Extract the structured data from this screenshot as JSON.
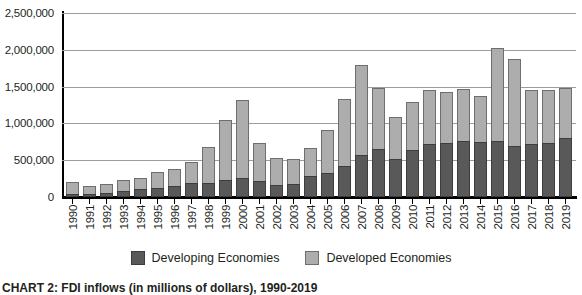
{
  "chart_data": {
    "type": "bar",
    "stacked": true,
    "title": "",
    "xlabel": "",
    "ylabel": "",
    "ylim": [
      0,
      2500000
    ],
    "ytick_values": [
      0,
      500000,
      1000000,
      1500000,
      2000000,
      2500000
    ],
    "ytick_labels": [
      "0",
      "500,000",
      "1,000,000",
      "1,500,000",
      "2,000,000",
      "2,500,000"
    ],
    "grid": true,
    "legend_position": "bottom",
    "categories": [
      "1990",
      "1991",
      "1992",
      "1993",
      "1994",
      "1995",
      "1996",
      "1997",
      "1998",
      "1999",
      "2000",
      "2001",
      "2002",
      "2003",
      "2004",
      "2005",
      "2006",
      "2007",
      "2008",
      "2009",
      "2010",
      "2011",
      "2012",
      "2013",
      "2014",
      "2015",
      "2016",
      "2017",
      "2018",
      "2019"
    ],
    "series": [
      {
        "name": "Developing Economies",
        "color": "#595959",
        "values": [
          35000,
          42000,
          55000,
          80000,
          103000,
          119000,
          147000,
          193000,
          194000,
          232000,
          257000,
          219000,
          166000,
          180000,
          290000,
          332000,
          427000,
          574000,
          658000,
          519000,
          637000,
          725000,
          729000,
          756000,
          743000,
          765000,
          690000,
          716000,
          730000,
          805000
        ]
      },
      {
        "name": "Developed Economies",
        "color": "#adadad",
        "values": [
          172000,
          113000,
          116000,
          145000,
          156000,
          222000,
          239000,
          281000,
          485000,
          820000,
          1065000,
          513000,
          365000,
          340000,
          378000,
          578000,
          900000,
          1216000,
          820000,
          570000,
          650000,
          735000,
          700000,
          711000,
          630000,
          1265000,
          1180000,
          740000,
          720000,
          675000
        ]
      }
    ],
    "totals": [
      207000,
      155000,
      171000,
      225000,
      259000,
      341000,
      386000,
      474000,
      679000,
      1052000,
      1322000,
      732000,
      531000,
      520000,
      668000,
      910000,
      1327000,
      1790000,
      1478000,
      1089000,
      1287000,
      1460000,
      1429000,
      1467000,
      1373000,
      2030000,
      1870000,
      1456000,
      1450000,
      1480000
    ]
  },
  "legend": {
    "items": [
      {
        "label": "Developing Economies",
        "swatch": "dark-gray-swatch"
      },
      {
        "label": "Developed Economies",
        "swatch": "light-gray-swatch"
      }
    ]
  },
  "caption": {
    "text": "CHART 2: FDI inflows (in millions of dollars), 1990-2019"
  }
}
